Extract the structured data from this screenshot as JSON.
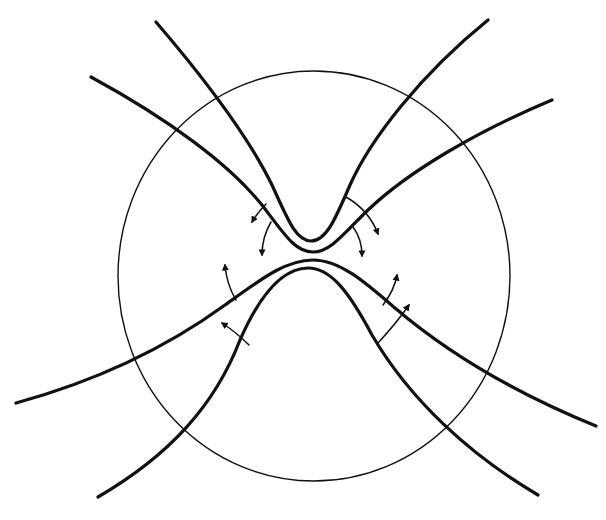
{
  "diagram": {
    "type": "field-line-reconnection",
    "background": "#ffffff",
    "ink": "#111111",
    "boundary_circle": {
      "cx": 314,
      "cy": 276,
      "rx": 196,
      "ry": 205,
      "stroke_width": 1.4
    },
    "field_lines": [
      {
        "name": "upper-left-outer-line",
        "d": "M91,77 C170,120 230,165 262,205 C285,235 295,252 313,252 C331,252 345,232 368,210 C410,170 480,130 552,100",
        "stroke_width": 3.2
      },
      {
        "name": "upper-inner-v-line",
        "d": "M156,22 C210,85 250,140 272,185 C288,220 296,241 311,241 C326,241 335,220 350,185 C370,140 420,75 488,20",
        "stroke_width": 3.2
      },
      {
        "name": "lower-outer-arch-line",
        "d": "M16,403 C100,380 170,345 225,305 C260,280 285,260 313,260 C340,260 365,282 395,308 C450,355 520,395 596,426",
        "stroke_width": 3.2
      },
      {
        "name": "lower-inner-arch-line",
        "d": "M98,497 C170,455 215,405 240,340 C262,290 285,268 308,268 C330,268 348,290 372,335 C410,400 470,455 538,495",
        "stroke_width": 3.2
      }
    ],
    "arrows": [
      {
        "name": "arrow-upper-left-outward",
        "d": "M266,204 C260,210 256,215 252,222"
      },
      {
        "name": "arrow-upper-left-downward",
        "d": "M271,222 C265,232 262,243 262,255"
      },
      {
        "name": "arrow-upper-right-outward",
        "d": "M346,197 C360,205 372,218 378,234"
      },
      {
        "name": "arrow-upper-right-downward",
        "d": "M353,227 C359,235 362,245 362,256"
      },
      {
        "name": "arrow-lower-left-upward",
        "d": "M236,300 C230,290 226,278 225,265"
      },
      {
        "name": "arrow-lower-left-inward",
        "d": "M249,345 C240,336 231,329 222,323"
      },
      {
        "name": "arrow-lower-right-upward",
        "d": "M383,305 C390,296 395,286 397,275"
      },
      {
        "name": "arrow-lower-right-outward",
        "d": "M378,343 C390,330 400,318 409,305"
      }
    ],
    "arrow_stroke_width": 1.5
  }
}
